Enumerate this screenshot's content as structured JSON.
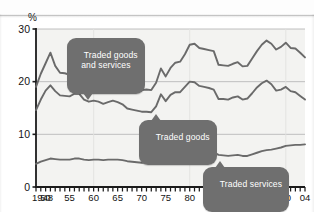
{
  "axis": {
    "y_unit_label": "%",
    "y_ticks": [
      "0",
      "10",
      "20",
      "30"
    ],
    "x_ticks": [
      "1948",
      "50",
      "55",
      "60",
      "65",
      "70",
      "75",
      "80",
      "85",
      "90",
      "95",
      "00",
      "04"
    ]
  },
  "callouts": {
    "traded_goods_and_services": "Traded goods\nand services",
    "traded_goods": "Traded goods",
    "traded_services": "Traded services"
  },
  "colors": {
    "line": "#6a6a6a",
    "callout_bg": "#6f6f6f",
    "plot_bg": "#f3f3f1",
    "gridline": "#b9b9b9",
    "axis": "#1b1b1b"
  },
  "chart_data": {
    "type": "line",
    "title": "",
    "subtitle": "",
    "xlabel": "",
    "ylabel": "%",
    "xlim": [
      1948,
      2004
    ],
    "ylim": [
      0,
      30
    ],
    "grid": true,
    "legend_position": "inline-callouts",
    "annotations": [
      "Traded goods and services",
      "Traded goods",
      "Traded services"
    ],
    "x": [
      1948,
      1949,
      1950,
      1951,
      1952,
      1953,
      1954,
      1955,
      1956,
      1957,
      1958,
      1959,
      1960,
      1961,
      1962,
      1963,
      1964,
      1965,
      1966,
      1967,
      1968,
      1969,
      1970,
      1971,
      1972,
      1973,
      1974,
      1975,
      1976,
      1977,
      1978,
      1979,
      1980,
      1981,
      1982,
      1983,
      1984,
      1985,
      1986,
      1987,
      1988,
      1989,
      1990,
      1991,
      1992,
      1993,
      1994,
      1995,
      1996,
      1997,
      1998,
      1999,
      2000,
      2001,
      2002,
      2003,
      2004
    ],
    "series": [
      {
        "name": "Traded goods and services",
        "values": [
          19.0,
          21.5,
          23.5,
          25.5,
          23.0,
          21.7,
          21.6,
          21.3,
          22.2,
          22.4,
          21.0,
          20.6,
          20.9,
          20.7,
          20.3,
          20.6,
          21.0,
          20.7,
          20.2,
          19.3,
          19.0,
          18.7,
          18.4,
          18.5,
          18.4,
          19.8,
          22.5,
          21.0,
          22.6,
          23.6,
          23.8,
          25.2,
          27.0,
          27.2,
          26.4,
          26.2,
          26.0,
          25.8,
          23.2,
          23.1,
          23.0,
          23.4,
          23.7,
          22.9,
          23.0,
          24.4,
          25.8,
          27.0,
          27.8,
          27.2,
          26.1,
          26.6,
          27.4,
          26.4,
          26.3,
          25.5,
          24.6
        ]
      },
      {
        "name": "Traded goods",
        "values": [
          14.6,
          16.6,
          18.3,
          19.3,
          18.2,
          17.4,
          17.3,
          17.2,
          17.7,
          17.7,
          16.6,
          16.2,
          16.4,
          16.2,
          15.8,
          16.1,
          16.4,
          16.1,
          15.7,
          14.9,
          14.7,
          14.5,
          14.3,
          14.3,
          14.2,
          15.3,
          17.6,
          16.3,
          17.5,
          18.0,
          18.0,
          19.0,
          20.0,
          19.9,
          19.2,
          19.0,
          18.8,
          18.5,
          16.7,
          16.7,
          16.6,
          17.0,
          17.2,
          16.6,
          16.8,
          17.8,
          18.9,
          19.7,
          20.2,
          19.5,
          18.3,
          18.5,
          19.0,
          18.2,
          18.0,
          17.3,
          16.6
        ]
      },
      {
        "name": "Traded services",
        "values": [
          4.4,
          4.8,
          5.1,
          5.4,
          5.3,
          5.2,
          5.2,
          5.2,
          5.4,
          5.4,
          5.2,
          5.1,
          5.2,
          5.2,
          5.1,
          5.2,
          5.2,
          5.2,
          5.1,
          4.9,
          4.8,
          4.7,
          4.6,
          4.7,
          4.7,
          5.0,
          5.5,
          5.3,
          5.7,
          6.0,
          6.1,
          6.4,
          6.8,
          6.8,
          6.6,
          6.6,
          6.6,
          6.6,
          6.1,
          6.0,
          5.9,
          6.0,
          6.1,
          5.9,
          5.9,
          6.2,
          6.5,
          6.8,
          7.0,
          7.1,
          7.3,
          7.5,
          7.8,
          7.9,
          8.0,
          8.0,
          8.1
        ]
      }
    ]
  }
}
